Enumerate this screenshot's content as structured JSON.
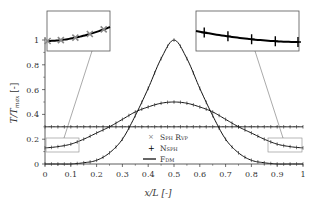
{
  "chart_data": {
    "type": "line",
    "title": "",
    "xlabel": "x/L [-]",
    "ylabel": "T/T_max [-]",
    "xlim": [
      0,
      1
    ],
    "ylim": [
      0,
      1
    ],
    "x_ticks": [
      "0",
      "0.1",
      "0.2",
      "0.3",
      "0.4",
      "0.5",
      "0.6",
      "0.7",
      "0.8",
      "0.9",
      "1"
    ],
    "y_ticks": [
      "0",
      "0.2",
      "0.4",
      "0.6",
      "0.8",
      "1"
    ],
    "grid": false,
    "legend_position": "center-right",
    "legend": [
      {
        "label": "Sph Rvp",
        "marker": "x",
        "color": "#808080"
      },
      {
        "label": "Nsph",
        "marker": "+",
        "color": "#000000"
      },
      {
        "label": "Fdm",
        "marker": "line",
        "color": "#000000"
      }
    ],
    "x": [
      0,
      0.05,
      0.1,
      0.15,
      0.2,
      0.25,
      0.3,
      0.35,
      0.4,
      0.45,
      0.5,
      0.55,
      0.6,
      0.65,
      0.7,
      0.75,
      0.8,
      0.85,
      0.9,
      0.95,
      1
    ],
    "series": [
      {
        "name": "Gaussian narrow (t0)",
        "values": [
          0.0,
          0.0,
          0.0,
          0.01,
          0.03,
          0.09,
          0.2,
          0.39,
          0.61,
          0.85,
          1.0,
          0.85,
          0.61,
          0.39,
          0.2,
          0.09,
          0.03,
          0.01,
          0.0,
          0.0,
          0.0
        ]
      },
      {
        "name": "Gaussian wide (t1)",
        "values": [
          0.13,
          0.14,
          0.16,
          0.2,
          0.25,
          0.3,
          0.36,
          0.42,
          0.46,
          0.49,
          0.5,
          0.49,
          0.46,
          0.42,
          0.36,
          0.3,
          0.25,
          0.2,
          0.16,
          0.14,
          0.13
        ]
      },
      {
        "name": "Flat (t2)",
        "values": [
          0.3,
          0.3,
          0.3,
          0.3,
          0.3,
          0.3,
          0.3,
          0.3,
          0.3,
          0.3,
          0.3,
          0.3,
          0.3,
          0.3,
          0.3,
          0.3,
          0.3,
          0.3,
          0.3,
          0.3,
          0.3
        ]
      }
    ],
    "annotations": [
      {
        "type": "inset",
        "label": "left zoom",
        "region_x": [
          0,
          0.13
        ],
        "region_y": [
          0.1,
          0.2
        ],
        "markers": "x (Sph Rvp)"
      },
      {
        "type": "inset",
        "label": "right zoom",
        "region_x": [
          0.87,
          1
        ],
        "region_y": [
          0.1,
          0.2
        ],
        "markers": "+ (Nsph)"
      }
    ]
  },
  "legend": {
    "sph_rvp": "Sph Rvp",
    "nsph": "Nsph",
    "fdm": "Fdm"
  },
  "axes": {
    "xlabel": "x/L [-]",
    "ylabel": "T/T",
    "ylabel_sub": "max",
    "ylabel_suffix": " [-]"
  }
}
